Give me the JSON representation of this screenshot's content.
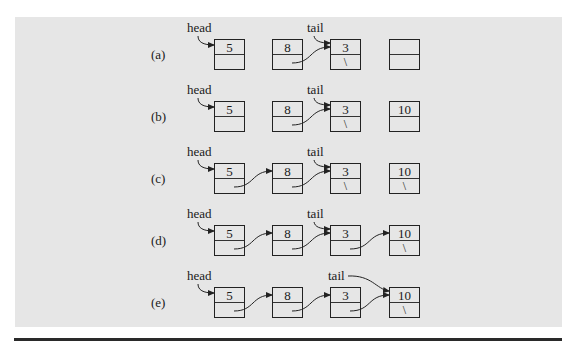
{
  "figure": {
    "type": "linked-list-diagram",
    "background": "#e6e6e6",
    "rows": [
      {
        "label": "(a)",
        "nodes": [
          {
            "data": "5",
            "next": ""
          },
          {
            "data": "8",
            "next": ""
          },
          {
            "data": "3",
            "next": "\\"
          },
          {
            "data": "",
            "next": ""
          }
        ],
        "links": [
          [
            1,
            2
          ]
        ],
        "head_label": "head",
        "head_target": 0,
        "tail_label": "tail",
        "tail_target": 2
      },
      {
        "label": "(b)",
        "nodes": [
          {
            "data": "5",
            "next": ""
          },
          {
            "data": "8",
            "next": ""
          },
          {
            "data": "3",
            "next": "\\"
          },
          {
            "data": "10",
            "next": ""
          }
        ],
        "links": [
          [
            1,
            2
          ]
        ],
        "head_label": "head",
        "head_target": 0,
        "tail_label": "tail",
        "tail_target": 2
      },
      {
        "label": "(c)",
        "nodes": [
          {
            "data": "5",
            "next": ""
          },
          {
            "data": "8",
            "next": ""
          },
          {
            "data": "3",
            "next": "\\"
          },
          {
            "data": "10",
            "next": "\\"
          }
        ],
        "links": [
          [
            0,
            1
          ],
          [
            1,
            2
          ]
        ],
        "head_label": "head",
        "head_target": 0,
        "tail_label": "tail",
        "tail_target": 2
      },
      {
        "label": "(d)",
        "nodes": [
          {
            "data": "5",
            "next": ""
          },
          {
            "data": "8",
            "next": ""
          },
          {
            "data": "3",
            "next": ""
          },
          {
            "data": "10",
            "next": "\\"
          }
        ],
        "links": [
          [
            0,
            1
          ],
          [
            1,
            2
          ],
          [
            2,
            3
          ]
        ],
        "head_label": "head",
        "head_target": 0,
        "tail_label": "tail",
        "tail_target": 2
      },
      {
        "label": "(e)",
        "nodes": [
          {
            "data": "5",
            "next": ""
          },
          {
            "data": "8",
            "next": ""
          },
          {
            "data": "3",
            "next": ""
          },
          {
            "data": "10",
            "next": "\\"
          }
        ],
        "links": [
          [
            0,
            1
          ],
          [
            1,
            2
          ],
          [
            2,
            3
          ]
        ],
        "head_label": "head",
        "head_target": 0,
        "tail_label": "tail",
        "tail_target": 3
      }
    ]
  }
}
